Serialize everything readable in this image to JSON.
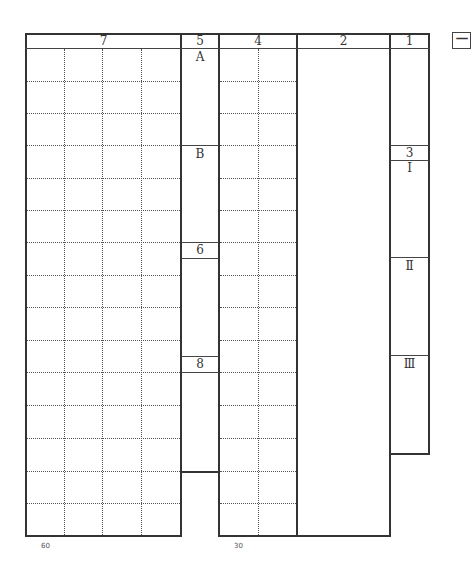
{
  "sheet": {
    "headers": {
      "col7": "7",
      "col5": "5",
      "col4": "4",
      "col2": "2",
      "col1": "1"
    },
    "col5_labels": {
      "top": "A",
      "second": "B",
      "box6": "6",
      "box8": "8"
    },
    "col1_labels": {
      "box3": "3",
      "section1": "Ⅰ",
      "section2": "Ⅱ",
      "section3": "Ⅲ"
    },
    "side_mark": "一",
    "footer": {
      "left_count": "60",
      "middle_count": "30"
    }
  }
}
